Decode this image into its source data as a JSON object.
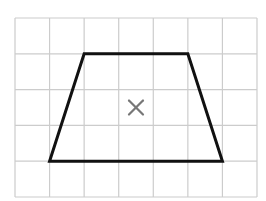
{
  "diagram": {
    "type": "grid-shape",
    "grid": {
      "columns": 7,
      "rows": 5,
      "left": 15,
      "top": 18,
      "cell_width": 34.57,
      "cell_height": 35.8,
      "line_color": "#cccccc"
    },
    "shape": {
      "name": "trapezoid",
      "vertices_grid": [
        [
          2,
          1
        ],
        [
          5,
          1
        ],
        [
          6,
          4
        ],
        [
          1,
          4
        ]
      ],
      "stroke_color": "#111111",
      "stroke_width": 3
    },
    "marker": {
      "name": "centre-cross",
      "glyph": "×",
      "position_grid": [
        3.5,
        2.5
      ],
      "color": "#777777"
    }
  }
}
